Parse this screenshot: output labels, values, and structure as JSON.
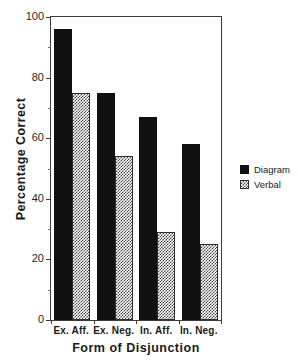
{
  "chart_data": {
    "type": "bar",
    "title": "",
    "subtitle": "",
    "xlabel": "Form of Disjunction",
    "ylabel": "Percentage Correct",
    "categories": [
      "Ex. Aff.",
      "Ex. Neg.",
      "In. Aff.",
      "In. Neg."
    ],
    "series": [
      {
        "name": "Diagram",
        "values": [
          96,
          75,
          67,
          58
        ],
        "color": "#111111",
        "fill": "solid-black"
      },
      {
        "name": "Verbal",
        "values": [
          75,
          54,
          29,
          25
        ],
        "color": "#4a4a4a",
        "fill": "checkerboard-gray"
      }
    ],
    "ylim": [
      0,
      100
    ],
    "y_major_ticks": [
      0,
      20,
      40,
      60,
      80,
      100
    ],
    "y_minor_ticks": [
      10,
      30,
      50,
      70,
      90
    ],
    "y_tick_labels": [
      "0",
      "20",
      "40",
      "60",
      "80",
      "100"
    ],
    "grid": false,
    "legend_position": "right",
    "legend_entries": [
      "Diagram",
      "Verbal"
    ],
    "annotations": []
  },
  "axes": {
    "y_title": "Percentage Correct",
    "x_title": "Form of Disjunction"
  },
  "legend": {
    "entries": [
      {
        "label": "Diagram",
        "swatch": "solid-black-swatch"
      },
      {
        "label": "Verbal",
        "swatch": "checkerboard-gray-swatch"
      }
    ]
  }
}
